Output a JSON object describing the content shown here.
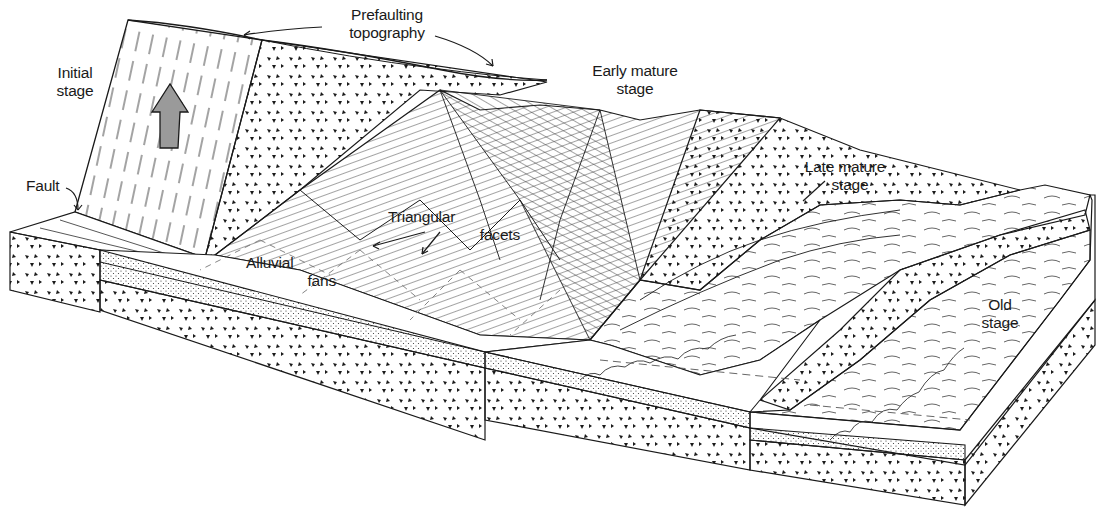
{
  "figure": {
    "colors": {
      "ink": "#1a1a1a",
      "background": "#ffffff",
      "arrow_fill": "#9a9a9a"
    }
  },
  "labels": {
    "prefaulting": {
      "line1": "Prefaulting",
      "line2": "topography"
    },
    "initial": {
      "line1": "Initial",
      "line2": "stage"
    },
    "early_mature": {
      "line1": "Early mature",
      "line2": "stage"
    },
    "late_mature": {
      "line1": "Late mature",
      "line2": "stage"
    },
    "fault": "Fault",
    "triangular_facets": {
      "line1": "Triangular",
      "line2": "facets"
    },
    "alluvial_fans": {
      "line1": "Alluvial",
      "line2": "fans"
    },
    "old": {
      "line1": "Old",
      "line2": "stage"
    }
  },
  "legend_semantics": {
    "uplift_arrow": "uplift-arrow-icon",
    "bedrock_pattern": "triangle-chevron bedrock texture",
    "alluvium_pattern": "stippled alluvium texture"
  }
}
